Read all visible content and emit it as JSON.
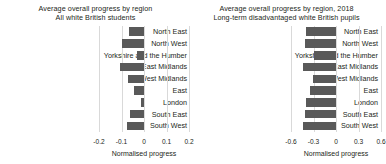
{
  "chart_data": [
    {
      "type": "bar",
      "orientation": "horizontal",
      "panel": "left",
      "title": "Average overall progress by region",
      "subtitle": "All white British students",
      "xlabel": "Normalised progress",
      "ylabel": "",
      "categories": [
        "North East",
        "North West",
        "Yorkshire and the Humber",
        "East Midlands",
        "West Midlands",
        "East",
        "London",
        "South East",
        "South West"
      ],
      "values": [
        -0.068,
        -0.098,
        -0.032,
        -0.108,
        -0.072,
        -0.046,
        -0.012,
        -0.062,
        -0.076
      ],
      "xlim": [
        -0.2,
        0.2
      ],
      "xticks": [
        -0.2,
        -0.1,
        0,
        0.1,
        0.2
      ],
      "xticklabels": [
        "-0.2",
        "-0.1",
        "0",
        "0.1",
        "0.2"
      ],
      "grid": true,
      "bar_color": "#595959"
    },
    {
      "type": "bar",
      "orientation": "horizontal",
      "panel": "right",
      "title": "Average overall progress by region, 2018",
      "subtitle": "Long-term disadvantaged white British pupils",
      "xlabel": "Normalised progress",
      "ylabel": "",
      "categories": [
        "North East",
        "North West",
        "Yorkshire and the Humber",
        "East Midlands",
        "West Midlands",
        "East",
        "London",
        "South East",
        "South West"
      ],
      "values": [
        -0.4,
        -0.42,
        -0.3,
        -0.44,
        -0.31,
        -0.35,
        -0.4,
        -0.42,
        -0.44
      ],
      "xlim": [
        -0.6,
        0.6
      ],
      "xticks": [
        -0.6,
        -0.3,
        0,
        0.3,
        0.6
      ],
      "xticklabels": [
        "-0.6",
        "-0.3",
        "0",
        "0.3",
        "0.6"
      ],
      "grid": true,
      "bar_color": "#595959"
    }
  ]
}
